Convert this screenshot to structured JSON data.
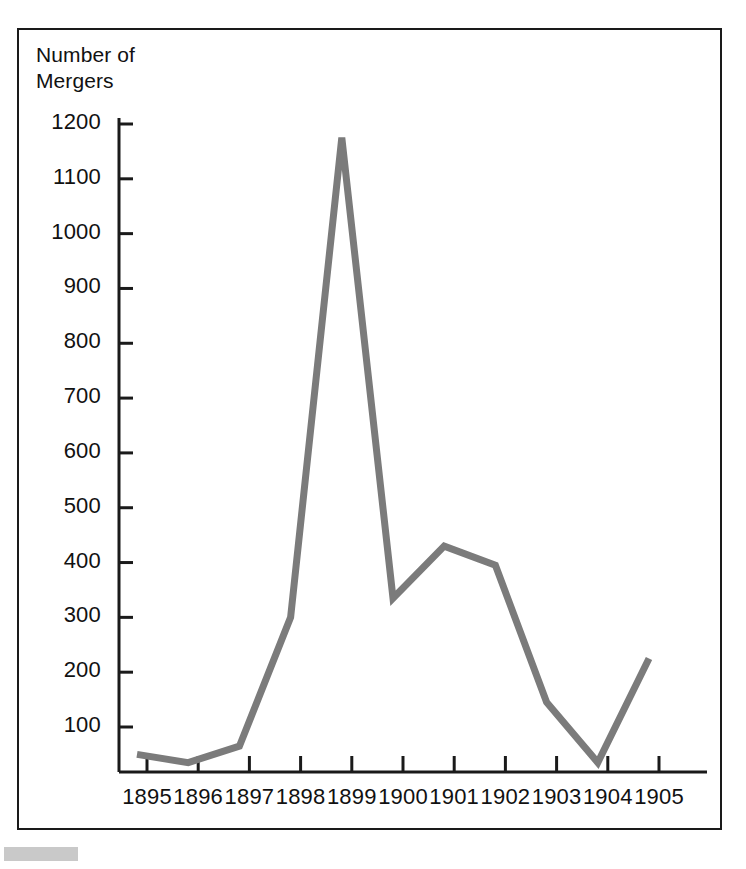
{
  "chart_data": {
    "type": "line",
    "title": "Number of\nMergers",
    "xlabel": "",
    "ylabel": "Number of Mergers",
    "x": [
      1895,
      1896,
      1897,
      1898,
      1899,
      1900,
      1901,
      1902,
      1903,
      1904,
      1905
    ],
    "values": [
      50,
      35,
      65,
      300,
      1175,
      335,
      430,
      395,
      145,
      35,
      225
    ],
    "series": [
      {
        "name": "Number of Mergers",
        "values": [
          50,
          35,
          65,
          300,
          1175,
          335,
          430,
          395,
          145,
          35,
          225
        ]
      }
    ],
    "categories": [
      "1895",
      "1896",
      "1897",
      "1898",
      "1899",
      "1900",
      "1901",
      "1902",
      "1903",
      "1904",
      "1905"
    ],
    "xtick_labels": [
      "1895",
      "1896",
      "1897",
      "1898",
      "1899",
      "1900",
      "1901",
      "1902",
      "1903",
      "1904",
      "1905"
    ],
    "ytick_labels": [
      "1200",
      "1100",
      "1000",
      "900",
      "800",
      "700",
      "600",
      "500",
      "400",
      "300",
      "200",
      "100"
    ],
    "ytick_values": [
      1200,
      1100,
      1000,
      900,
      800,
      700,
      600,
      500,
      400,
      300,
      200,
      100
    ],
    "ylim": [
      0,
      1250
    ],
    "xlim": [
      1894.6,
      1905.4
    ],
    "grid": false,
    "legend": false,
    "legend_position": "none",
    "line_color": "#7b7b7b",
    "axis_color": "#1a1a1a",
    "frame_color": "#1a1a1a",
    "background": "#ffffff"
  },
  "figure": {
    "title_line_1": "Number of",
    "title_line_2": "Mergers"
  }
}
